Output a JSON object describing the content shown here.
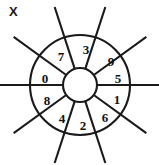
{
  "figure": {
    "corner_label": "X",
    "type": "segmented-wheel-diagram",
    "line_color": "#1a1a1a",
    "fill_color": "#ffffff",
    "background": "#ffffff",
    "center": {
      "x": 80,
      "y": 85
    },
    "outer_radius": 50,
    "inner_radius": 17,
    "spoke_outer_extent": 82,
    "sector_count": 10,
    "sector_angle_deg": 36,
    "digits_clockwise_from_top": [
      3,
      9,
      5,
      1,
      6,
      2,
      4,
      8,
      0,
      7
    ],
    "sectors": [
      {
        "index": 0,
        "label": "3",
        "position": "top-center-right",
        "center_angle_deg": -72,
        "label_x": 86,
        "label_y": 49
      },
      {
        "index": 1,
        "label": "9",
        "position": "upper-right",
        "center_angle_deg": -36,
        "label_x": 111,
        "label_y": 61
      },
      {
        "index": 2,
        "label": "5",
        "position": "right-upper",
        "center_angle_deg": 0,
        "label_x": 118,
        "label_y": 78
      },
      {
        "index": 3,
        "label": "1",
        "position": "right-lower",
        "center_angle_deg": 36,
        "label_x": 117,
        "label_y": 99
      },
      {
        "index": 4,
        "label": "6",
        "position": "lower-right",
        "center_angle_deg": 72,
        "label_x": 105,
        "label_y": 117
      },
      {
        "index": 5,
        "label": "2",
        "position": "bottom-center-right",
        "center_angle_deg": 108,
        "label_x": 83,
        "label_y": 125
      },
      {
        "index": 6,
        "label": "4",
        "position": "bottom-center-left",
        "center_angle_deg": 144,
        "label_x": 62,
        "label_y": 118
      },
      {
        "index": 7,
        "label": "8",
        "position": "left-lower",
        "center_angle_deg": 180,
        "label_x": 47,
        "label_y": 100
      },
      {
        "index": 8,
        "label": "0",
        "position": "left-upper",
        "center_angle_deg": -144,
        "label_x": 45,
        "label_y": 78
      },
      {
        "index": 9,
        "label": "7",
        "position": "upper-left",
        "center_angle_deg": -108,
        "label_x": 61,
        "label_y": 56
      }
    ]
  }
}
